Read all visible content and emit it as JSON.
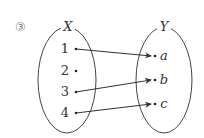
{
  "problem_number": "③",
  "set_x": {
    "label": "X",
    "elements": [
      "1",
      "2",
      "3",
      "4"
    ]
  },
  "set_y": {
    "label": "Y",
    "elements": [
      "a",
      "b",
      "c"
    ]
  },
  "mapping": [
    {
      "from": "1",
      "to": "a"
    },
    {
      "from": "3",
      "to": "b"
    },
    {
      "from": "4",
      "to": "c"
    }
  ],
  "colors": {
    "line": "#333333",
    "number": "#888888"
  }
}
